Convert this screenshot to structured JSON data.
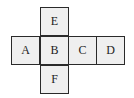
{
  "diagram": {
    "type": "cube-net",
    "cells": [
      {
        "label": "E",
        "row": 0,
        "col": 1
      },
      {
        "label": "A",
        "row": 1,
        "col": 0
      },
      {
        "label": "B",
        "row": 1,
        "col": 1
      },
      {
        "label": "C",
        "row": 1,
        "col": 2
      },
      {
        "label": "D",
        "row": 1,
        "col": 3
      },
      {
        "label": "F",
        "row": 2,
        "col": 1
      }
    ]
  }
}
